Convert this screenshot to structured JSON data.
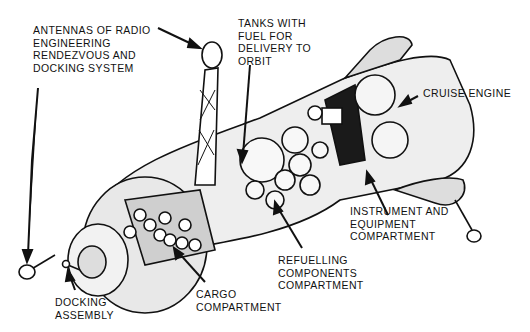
{
  "diagram": {
    "labels": {
      "antennas": "ANTENNAS OF RADIO\nENGINEERING\nRENDEZVOUS AND\nDOCKING SYSTEM",
      "tanks": "TANKS WITH\nFUEL FOR\nDELIVERY TO\nORBIT",
      "cruise_engine": "CRUISE ENGINE",
      "instrument": "INSTRUMENT AND\nEQUIPMENT\nCOMPARTMENT",
      "refuelling": "REFUELLING\nCOMPONENTS\nCOMPARTMENT",
      "cargo": "CARGO\nCOMPARTMENT",
      "docking": "DOCKING\nASSEMBLY"
    },
    "colors": {
      "ink": "#111111",
      "fill_light": "#e6e6e6",
      "fill_mid": "#c8c8c8",
      "fill_dark": "#1a1a1a",
      "background": "#ffffff"
    }
  }
}
